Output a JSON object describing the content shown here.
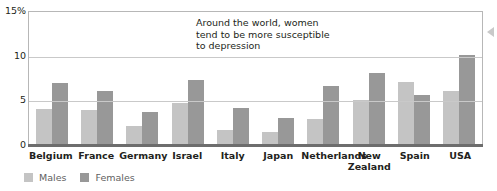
{
  "chart_data": {
    "type": "bar",
    "title": "",
    "subtitle": "",
    "xlabel": "",
    "ylabel": "",
    "ylim": [
      0,
      15
    ],
    "yticks": [
      0,
      5,
      10,
      15
    ],
    "ytick_labels": [
      "0",
      "5",
      "10",
      "15%"
    ],
    "grid": "horizontal",
    "legend_position": "bottom-left",
    "categories": [
      "Belgium",
      "France",
      "Germany",
      "Israel",
      "Italy",
      "Japan",
      "Netherlands",
      "New Zealand",
      "Spain",
      "USA"
    ],
    "category_lines": [
      [
        "Belgium"
      ],
      [
        "France"
      ],
      [
        "Germany"
      ],
      [
        "Israel"
      ],
      [
        "Italy"
      ],
      [
        "Japan"
      ],
      [
        "Netherlands"
      ],
      [
        "New",
        "Zealand"
      ],
      [
        "Spain"
      ],
      [
        "USA"
      ]
    ],
    "series": [
      {
        "name": "Males",
        "color": "#c4c4c4",
        "values": [
          4.0,
          3.9,
          2.1,
          4.7,
          1.7,
          1.5,
          2.9,
          5.0,
          7.1,
          6.1
        ]
      },
      {
        "name": "Females",
        "color": "#989898",
        "values": [
          6.9,
          6.0,
          3.7,
          7.3,
          4.1,
          3.0,
          6.6,
          8.1,
          5.6,
          10.1
        ]
      }
    ],
    "annotations": [
      {
        "text": "Around the world, women tend to be more susceptible to depression",
        "lines": [
          "Around the world, women",
          "tend to be more susceptible",
          "to depression"
        ]
      }
    ]
  },
  "legend": {
    "items": [
      {
        "label": "Males",
        "color": "#c4c4c4"
      },
      {
        "label": "Females",
        "color": "#989898"
      }
    ]
  },
  "icons": {
    "edge_arrow": "triangle-left-icon"
  }
}
